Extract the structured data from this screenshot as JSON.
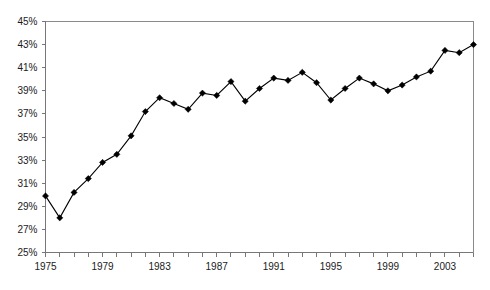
{
  "chart_data": {
    "type": "line",
    "title": "",
    "subtitle": "",
    "xlabel": "",
    "ylabel": "",
    "grid": false,
    "legend": "none",
    "marker": "diamond",
    "line_color": "#000000",
    "marker_color": "#000000",
    "axis_color": "#777777",
    "background_color": "#ffffff",
    "xlim": [
      1975,
      2005
    ],
    "ylim": [
      25,
      45
    ],
    "y_tick_step": 2,
    "x_tick_step": 1,
    "x_label_step": 4,
    "y_tick_labels": [
      "25%",
      "27%",
      "29%",
      "31%",
      "33%",
      "35%",
      "37%",
      "39%",
      "41%",
      "43%",
      "45%"
    ],
    "y_tick_values": [
      25,
      27,
      29,
      31,
      33,
      35,
      37,
      39,
      41,
      43,
      45
    ],
    "x_tick_labels": [
      "1975",
      "1979",
      "1983",
      "1987",
      "1991",
      "1995",
      "1999",
      "2003"
    ],
    "x_tick_values": [
      1975,
      1979,
      1983,
      1987,
      1991,
      1995,
      1999,
      2003
    ],
    "x": [
      1975,
      1976,
      1977,
      1978,
      1979,
      1980,
      1981,
      1982,
      1983,
      1984,
      1985,
      1986,
      1987,
      1988,
      1989,
      1990,
      1991,
      1992,
      1993,
      1994,
      1995,
      1996,
      1997,
      1998,
      1999,
      2000,
      2001,
      2002,
      2003,
      2004,
      2005
    ],
    "values": [
      29.9,
      28.0,
      30.2,
      31.4,
      32.8,
      33.5,
      35.1,
      37.2,
      38.4,
      37.9,
      37.4,
      38.8,
      38.6,
      39.8,
      38.1,
      39.2,
      40.1,
      39.9,
      40.6,
      39.7,
      38.2,
      39.2,
      40.1,
      39.6,
      39.0,
      39.5,
      40.2,
      40.7,
      42.5,
      42.3,
      43.0
    ],
    "series": [
      {
        "name": "",
        "values": [
          29.9,
          28.0,
          30.2,
          31.4,
          32.8,
          33.5,
          35.1,
          37.2,
          38.4,
          37.9,
          37.4,
          38.8,
          38.6,
          39.8,
          38.1,
          39.2,
          40.1,
          39.9,
          40.6,
          39.7,
          38.2,
          39.2,
          40.1,
          39.6,
          39.0,
          39.5,
          40.2,
          40.7,
          42.5,
          42.3,
          43.0
        ]
      }
    ],
    "annotations": []
  }
}
